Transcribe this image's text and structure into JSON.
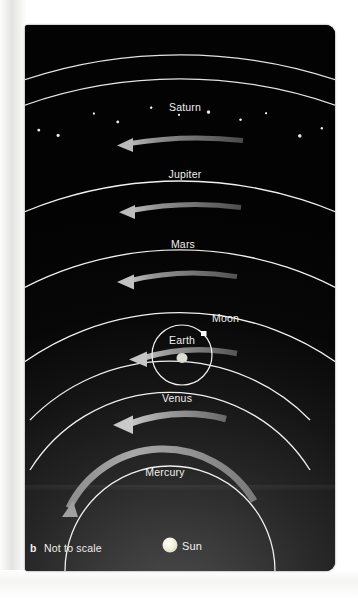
{
  "figure": {
    "panel_label": "b",
    "scale_note": "Not to scale",
    "background_color": "#040404",
    "orbit_color": "#f0f0ee",
    "label_color": "#f0f0ee",
    "arrow_color": "#9a9a9a"
  },
  "center_body": {
    "name": "Sun",
    "color": "#f2f0d8",
    "cx": 145,
    "cy": 520,
    "r": 7
  },
  "earth_system": {
    "earth_label": "Earth",
    "moon_label": "Moon",
    "earth_color": "#dcdcd4",
    "moon_color": "#ffffff"
  },
  "orbits": [
    {
      "body": "Mercury",
      "label": "Mercury",
      "radius": 105,
      "arrow_thickness": 6,
      "arrow_brightness": "#8e8e8e",
      "label_y": 451,
      "arc_start_deg": 188,
      "arc_end_deg": 352
    },
    {
      "body": "Venus",
      "label": "Venus",
      "radius": 165,
      "arrow_thickness": 6,
      "arrow_brightness": "#9a9a9a",
      "label_y": 381,
      "arc_start_deg": 215,
      "arc_end_deg": 325
    },
    {
      "body": "Earth",
      "label": "Earth",
      "radius": 196,
      "arrow_thickness": 5,
      "arrow_brightness": "#8a8a8a",
      "label_y": 321,
      "arc_start_deg": 233,
      "arc_end_deg": 307
    },
    {
      "body": "Mars",
      "label": "Mars",
      "radius": 270,
      "arrow_thickness": 5,
      "arrow_brightness": "#7e7e7e",
      "label_y": 240,
      "arc_start_deg": 242,
      "arc_end_deg": 298
    },
    {
      "body": "Jupiter",
      "label": "Jupiter",
      "radius": 340,
      "arrow_thickness": 5,
      "arrow_brightness": "#737373",
      "label_y": 172,
      "arc_start_deg": 245,
      "arc_end_deg": 295
    },
    {
      "body": "Saturn",
      "label": "Saturn",
      "radius": 408,
      "arrow_thickness": 5,
      "arrow_brightness": "#6e6e6e",
      "label_y": 105,
      "arc_start_deg": 246,
      "arc_end_deg": 294
    }
  ],
  "star_band": {
    "name": "star-sphere-band",
    "inner_radius": 470,
    "outer_radius": 495,
    "star_color": "#ffffff",
    "star_count": 46
  }
}
